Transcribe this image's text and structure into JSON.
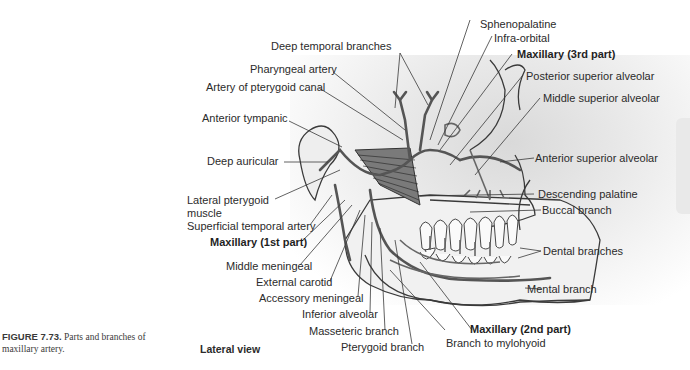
{
  "figure": {
    "number": "FIGURE 7.73.",
    "caption": "Parts and branches of maxillary artery.",
    "view": "Lateral view"
  },
  "labels": {
    "sphenopalatine": "Sphenopalatine",
    "infra_orbital": "Infra-orbital",
    "maxillary_3rd": "Maxillary (3rd part)",
    "posterior_superior_alveolar": "Posterior superior alveolar",
    "middle_superior_alveolar": "Middle superior alveolar",
    "anterior_superior_alveolar": "Anterior superior alveolar",
    "descending_palatine": "Descending palatine",
    "buccal_branch": "Buccal branch",
    "dental_branches": "Dental branches",
    "mental_branch": "Mental branch",
    "maxillary_2nd": "Maxillary (2nd part)",
    "branch_to_mylohyoid": "Branch to mylohyoid",
    "pterygoid_branch": "Pterygoid branch",
    "masseteric_branch": "Masseteric branch",
    "inferior_alveolar": "Inferior alveolar",
    "accessory_meningeal": "Accessory meningeal",
    "external_carotid": "External carotid",
    "middle_meningeal": "Middle meningeal",
    "maxillary_1st": "Maxillary (1st part)",
    "superficial_temporal_artery": "Superficial temporal artery",
    "lateral_pterygoid_muscle_line1": "Lateral pterygoid",
    "lateral_pterygoid_muscle_line2": "muscle",
    "deep_auricular": "Deep auricular",
    "anterior_tympanic": "Anterior tympanic",
    "artery_of_pterygoid_canal": "Artery of pterygoid canal",
    "pharyngeal_artery": "Pharyngeal artery",
    "deep_temporal_branches": "Deep temporal branches"
  },
  "colors": {
    "text": "#2b2b2b",
    "line": "#3a3a3a",
    "artery": "#555555",
    "shade": "#e2e2e2"
  }
}
